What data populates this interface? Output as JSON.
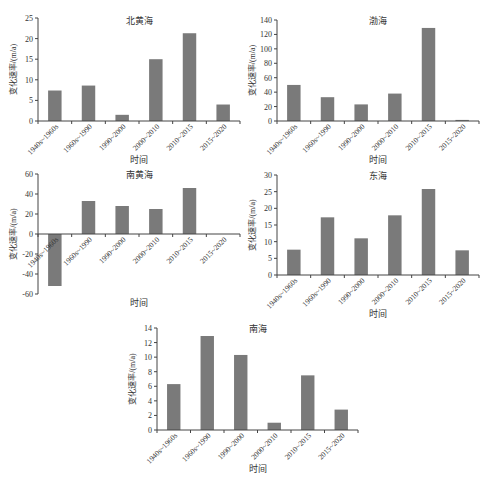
{
  "bar_color": "#7a7a7a",
  "axis_color": "#444444",
  "chart_data": [
    {
      "type": "bar",
      "title": "北黄海",
      "xlabel": "时间",
      "ylabel": "变化速率/(m/a)",
      "categories": [
        "1940s~1960s",
        "1960s~1990",
        "1990~2000",
        "2000~2010",
        "2010~2015",
        "2015~2020"
      ],
      "values": [
        7.4,
        8.6,
        1.5,
        15.0,
        21.3,
        4.0
      ],
      "ylim": [
        0,
        25
      ],
      "yticks": [
        0,
        5,
        10,
        15,
        20,
        25
      ],
      "grid": false,
      "legend": null
    },
    {
      "type": "bar",
      "title": "渤海",
      "xlabel": "时间",
      "ylabel": "变化速率/(m/a)",
      "categories": [
        "1940s~1960s",
        "1960s~1990",
        "1990~2000",
        "2000~2010",
        "2010~2015",
        "2015~2020"
      ],
      "values": [
        50,
        33,
        23,
        38,
        129,
        1.5
      ],
      "ylim": [
        0,
        140
      ],
      "yticks": [
        0,
        20,
        40,
        60,
        80,
        100,
        120,
        140
      ],
      "grid": false,
      "legend": null
    },
    {
      "type": "bar",
      "title": "南黄海",
      "xlabel": "时间",
      "ylabel": "变化速率/(m/a)",
      "categories": [
        "1940s~1960s",
        "1960s~1990",
        "1990~2000",
        "2000~2010",
        "2010~2015",
        "2015~2020"
      ],
      "values": [
        -52,
        33,
        28,
        25,
        46,
        0
      ],
      "ylim": [
        -60,
        60
      ],
      "yticks": [
        -60,
        -40,
        -20,
        0,
        20,
        40,
        60
      ],
      "grid": false,
      "legend": null
    },
    {
      "type": "bar",
      "title": "东海",
      "xlabel": "时间",
      "ylabel": "变化速率/(m/a)",
      "categories": [
        "1940s~1960s",
        "1960s~1990",
        "1990~2000",
        "2000~2010",
        "2010~2015",
        "2015~2020"
      ],
      "values": [
        7.6,
        17.3,
        11.0,
        17.9,
        25.8,
        7.4
      ],
      "ylim": [
        0,
        30
      ],
      "yticks": [
        0,
        5,
        10,
        15,
        20,
        25,
        30
      ],
      "grid": false,
      "legend": null
    },
    {
      "type": "bar",
      "title": "南海",
      "xlabel": "时间",
      "ylabel": "变化速率/(m/a)",
      "categories": [
        "1940s~1960s",
        "1960s~1990",
        "1990~2000",
        "2000~2010",
        "2010~2015",
        "2015~2020"
      ],
      "values": [
        6.3,
        12.9,
        10.3,
        1.0,
        7.5,
        2.8
      ],
      "ylim": [
        0,
        14
      ],
      "yticks": [
        0,
        2,
        4,
        6,
        8,
        10,
        12,
        14
      ],
      "grid": false,
      "legend": null
    }
  ],
  "layout": [
    {
      "x0": 38,
      "x1": 240,
      "yTop": 18,
      "yBot": 121,
      "titleY": 20
    },
    {
      "x0": 277,
      "x1": 479,
      "yTop": 20,
      "yBot": 121,
      "titleY": 20
    },
    {
      "x0": 38,
      "x1": 240,
      "yTop": 174,
      "yBot": 294,
      "titleY": 174
    },
    {
      "x0": 277,
      "x1": 479,
      "yTop": 175,
      "yBot": 275,
      "titleY": 175
    },
    {
      "x0": 157,
      "x1": 358,
      "yTop": 328,
      "yBot": 430,
      "titleY": 328
    }
  ]
}
